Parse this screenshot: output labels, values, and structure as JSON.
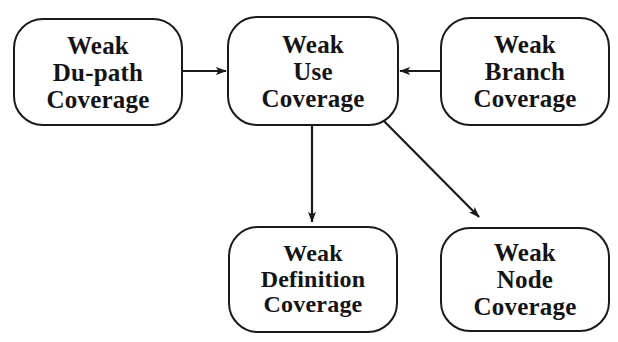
{
  "diagram": {
    "type": "directed-graph",
    "background_color": "#ffffff",
    "stroke_color": "#1a1a1a",
    "text_color": "#141414",
    "nodes": [
      {
        "id": "weak-du-path-coverage",
        "lines": [
          "Weak",
          "Du-path",
          "Coverage"
        ],
        "line1": "Weak",
        "line2": "Du-path",
        "line3": "Coverage",
        "x": 13,
        "y": 18,
        "width": 170,
        "height": 108
      },
      {
        "id": "weak-use-coverage",
        "lines": [
          "Weak",
          "Use",
          "Coverage"
        ],
        "line1": "Weak",
        "line2": "Use",
        "line3": "Coverage",
        "x": 227,
        "y": 16,
        "width": 172,
        "height": 110
      },
      {
        "id": "weak-branch-coverage",
        "lines": [
          "Weak",
          "Branch",
          "Coverage"
        ],
        "line1": "Weak",
        "line2": "Branch",
        "line3": "Coverage",
        "x": 440,
        "y": 17,
        "width": 170,
        "height": 109
      },
      {
        "id": "weak-definition-coverage",
        "lines": [
          "Weak",
          "Definition",
          "Coverage"
        ],
        "line1": "Weak",
        "line2": "Definition",
        "line3": "Coverage",
        "x": 228,
        "y": 226,
        "width": 170,
        "height": 107
      },
      {
        "id": "weak-node-coverage",
        "lines": [
          "Weak",
          "Node",
          "Coverage"
        ],
        "line1": "Weak",
        "line2": "Node",
        "line3": "Coverage",
        "x": 440,
        "y": 227,
        "width": 170,
        "height": 105
      }
    ],
    "edges": [
      {
        "id": "edge-du-path-to-use",
        "from": "weak-du-path-coverage",
        "to": "weak-use-coverage",
        "direction": "right",
        "x1": 183,
        "y1": 71,
        "x2": 226,
        "y2": 71
      },
      {
        "id": "edge-branch-to-use",
        "from": "weak-branch-coverage",
        "to": "weak-use-coverage",
        "direction": "left",
        "x1": 440,
        "y1": 71,
        "x2": 400,
        "y2": 71
      },
      {
        "id": "edge-use-to-definition",
        "from": "weak-use-coverage",
        "to": "weak-definition-coverage",
        "direction": "down",
        "x1": 312,
        "y1": 126,
        "x2": 312,
        "y2": 222
      },
      {
        "id": "edge-use-to-node",
        "from": "weak-use-coverage",
        "to": "weak-node-coverage",
        "direction": "down-right",
        "x1": 376,
        "y1": 113,
        "x2": 479,
        "y2": 217
      }
    ]
  }
}
